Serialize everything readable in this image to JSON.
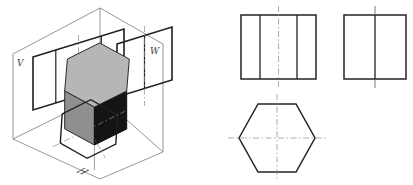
{
  "figure": {
    "plane_labels": {
      "frontal": "V",
      "profile": "W",
      "horizontal": "H"
    }
  },
  "colors": {
    "prism_top_face": "#b6b6b6",
    "prism_left_face": "#8f8f8f",
    "prism_front_face": "#141414",
    "line_dark": "#1f1f1f",
    "line_thin": "#6a6a6a",
    "centerline": "#8a8a8a"
  }
}
